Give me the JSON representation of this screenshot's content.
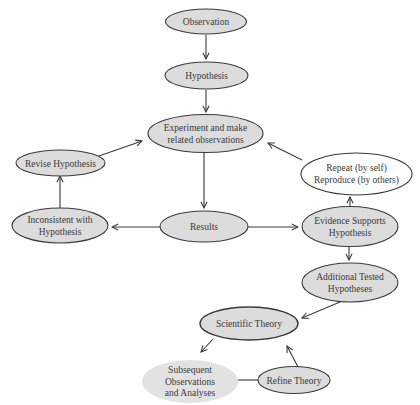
{
  "colors": {
    "node_fill": "#dcdcdc",
    "node_fill_light": "#e2e2e2",
    "node_fill_white": "#ffffff",
    "stroke": "#3a3a3a",
    "text": "#3a3a3a"
  },
  "nodes": {
    "observation": {
      "lines": [
        "Observation"
      ]
    },
    "hypothesis": {
      "lines": [
        "Hypothesis"
      ]
    },
    "experiment": {
      "lines": [
        "Experiment and make",
        "related observations"
      ]
    },
    "revise": {
      "lines": [
        "Revise Hypothesis"
      ]
    },
    "repeat": {
      "lines": [
        "Repeat (by self)",
        "Reproduce (by others)"
      ]
    },
    "inconsistent": {
      "lines": [
        "Inconsistent with",
        "Hypothesis"
      ]
    },
    "results": {
      "lines": [
        "Results"
      ]
    },
    "evidence": {
      "lines": [
        "Evidence Supports",
        "Hypothesis"
      ]
    },
    "additional": {
      "lines": [
        "Additional Tested",
        "Hypotheses"
      ]
    },
    "theory": {
      "lines": [
        "Scientific Theory"
      ]
    },
    "subsequent": {
      "lines": [
        "Subsequent",
        "Observations",
        "and Analyses"
      ]
    },
    "refine": {
      "lines": [
        "Refine Theory"
      ]
    }
  },
  "edges": [
    {
      "from": "observation",
      "to": "hypothesis"
    },
    {
      "from": "hypothesis",
      "to": "experiment"
    },
    {
      "from": "experiment",
      "to": "results"
    },
    {
      "from": "results",
      "to": "inconsistent"
    },
    {
      "from": "results",
      "to": "evidence"
    },
    {
      "from": "inconsistent",
      "to": "revise"
    },
    {
      "from": "revise",
      "to": "experiment"
    },
    {
      "from": "evidence",
      "to": "repeat"
    },
    {
      "from": "repeat",
      "to": "experiment"
    },
    {
      "from": "evidence",
      "to": "additional"
    },
    {
      "from": "additional",
      "to": "theory"
    },
    {
      "from": "theory",
      "to": "subsequent"
    },
    {
      "from": "subsequent",
      "to": "refine"
    },
    {
      "from": "refine",
      "to": "theory"
    }
  ]
}
